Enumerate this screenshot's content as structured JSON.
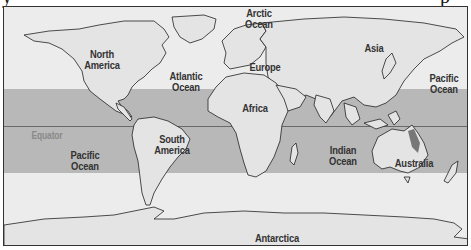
{
  "map": {
    "type": "world-map",
    "highlight_band": "tropics",
    "colors": {
      "ocean": "#ececec",
      "tropics_band": "#b8b8b8",
      "land": "#e4e4e4",
      "coastline": "#222222",
      "equator_line": "#6a6a6a",
      "equator_label": "#8a8a8a",
      "label": "#333333",
      "reef_marker": "#777777"
    },
    "labels": {
      "arctic_ocean": [
        "Arctic",
        "Ocean"
      ],
      "north_america": [
        "North",
        "America"
      ],
      "atlantic_ocean": [
        "Atlantic",
        "Ocean"
      ],
      "europe": "Europe",
      "asia": "Asia",
      "pacific_ocean_north": [
        "Pacific",
        "Ocean"
      ],
      "africa": "Africa",
      "equator": "Equator",
      "south_america": [
        "South",
        "America"
      ],
      "pacific_ocean_south": [
        "Pacific",
        "Ocean"
      ],
      "indian_ocean": [
        "Indian",
        "Ocean"
      ],
      "australia": "Australia",
      "antarctica": "Antarctica"
    }
  }
}
